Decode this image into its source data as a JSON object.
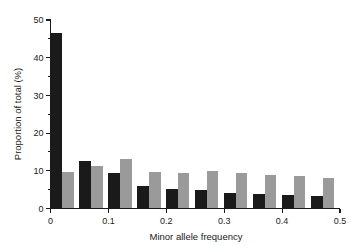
{
  "chart_data": {
    "type": "bar",
    "title": "",
    "subtitle": "",
    "xlabel": "Minor allele frequency",
    "ylabel": "Proportion of total (%)",
    "xlim": [
      0,
      0.5
    ],
    "ylim": [
      0,
      50
    ],
    "grid": false,
    "legend": "none",
    "x_tick_labels": [
      "0",
      "0.1",
      "0.2",
      "0.3",
      "0.4",
      "0.5"
    ],
    "x_tick_values": [
      0,
      0.1,
      0.2,
      0.3,
      0.4,
      0.5
    ],
    "y_tick_labels": [
      "0",
      "10",
      "20",
      "30",
      "40",
      "50"
    ],
    "y_tick_values": [
      0,
      10,
      20,
      30,
      40,
      50
    ],
    "y_minor_tick_values": [
      5,
      15,
      25,
      35,
      45
    ],
    "bin_width": 0.05,
    "bin_starts": [
      0,
      0.05,
      0.1,
      0.15,
      0.2,
      0.25,
      0.3,
      0.35,
      0.4,
      0.45
    ],
    "categories": [
      "0-0.05",
      "0.05-0.1",
      "0.1-0.15",
      "0.15-0.2",
      "0.2-0.25",
      "0.25-0.3",
      "0.3-0.35",
      "0.35-0.4",
      "0.4-0.45",
      "0.45-0.5"
    ],
    "series": [
      {
        "name": "dark",
        "color": "#1a1a1a",
        "values": [
          46.5,
          12.7,
          9.5,
          6.0,
          5.1,
          4.8,
          4.2,
          3.8,
          3.6,
          3.3
        ]
      },
      {
        "name": "gray",
        "color": "#9a9a9a",
        "values": [
          9.7,
          11.4,
          13.1,
          9.8,
          9.4,
          10.0,
          9.5,
          9.0,
          8.6,
          8.1
        ]
      }
    ]
  },
  "annotations": {
    "y_axis_title": "Proportion of total (%)",
    "x_axis_title": "Minor allele frequency"
  }
}
